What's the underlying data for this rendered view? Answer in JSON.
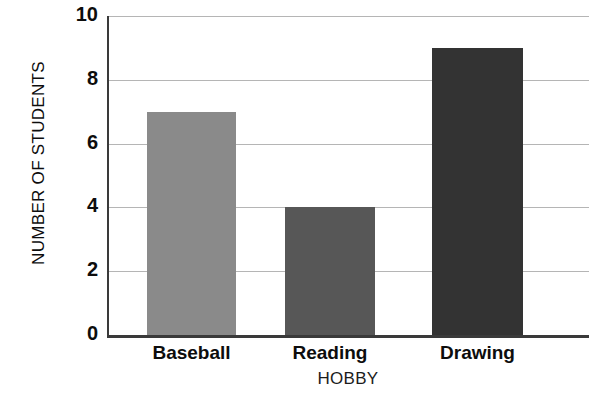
{
  "chart_data": {
    "type": "bar",
    "title": "",
    "xlabel": "HOBBY",
    "ylabel": "NUMBER OF STUDENTS",
    "categories": [
      "Baseball",
      "Reading",
      "Drawing"
    ],
    "values": [
      7,
      4,
      9
    ],
    "ylim": [
      0,
      10
    ],
    "ytick_labels": [
      "0",
      "2",
      "4",
      "6",
      "8",
      "10"
    ],
    "ytick_values": [
      0,
      2,
      4,
      6,
      8,
      10
    ],
    "grid": true,
    "legend": false,
    "bar_colors": [
      "#8a8a8a",
      "#575757",
      "#333333"
    ],
    "grid_color": "#b5b5b5",
    "axis_color": "#3a3a3a",
    "text_color": "#0d0d0d"
  }
}
